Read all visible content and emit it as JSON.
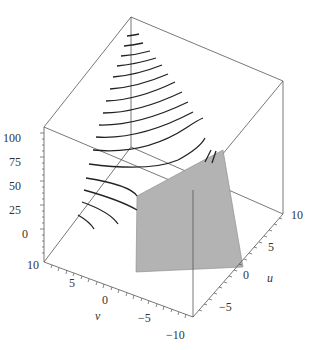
{
  "chart_data": {
    "type": "surface3d",
    "title": "",
    "axes": {
      "z": {
        "label": "",
        "ticks": [
          "0",
          "25",
          "50",
          "75",
          "100"
        ],
        "range": [
          0,
          100
        ]
      },
      "v": {
        "label": "v",
        "ticks": [
          "10",
          "5",
          "0",
          "-5",
          "-10"
        ],
        "range": [
          -10,
          10
        ]
      },
      "u": {
        "label": "u",
        "ticks": [
          "-5",
          "0",
          "5",
          "10"
        ],
        "range": [
          -10,
          10
        ]
      }
    },
    "box": "boxed",
    "series": [
      {
        "name": "curve family",
        "style": "black lines",
        "count": 15
      },
      {
        "name": "plane",
        "style": "gray filled polygon",
        "color": "#b3b3b3"
      }
    ]
  },
  "labels": {
    "z_ticks": [
      {
        "text": "100",
        "x": 3,
        "y": 131
      },
      {
        "text": "75",
        "x": 9,
        "y": 155
      },
      {
        "text": "50",
        "x": 9,
        "y": 179
      },
      {
        "text": "25",
        "x": 9,
        "y": 203
      },
      {
        "text": "0",
        "x": 22,
        "y": 227
      }
    ],
    "v_ticks": [
      {
        "text": "10",
        "x": 27,
        "y": 258
      },
      {
        "text": "5",
        "x": 69,
        "y": 276
      },
      {
        "text": "0",
        "x": 102,
        "y": 293
      },
      {
        "text": "−5",
        "x": 138,
        "y": 311
      },
      {
        "text": "−10",
        "x": 166,
        "y": 328
      }
    ],
    "u_ticks": [
      {
        "text": "10",
        "x": 291,
        "y": 208
      },
      {
        "text": "5",
        "x": 268,
        "y": 240
      },
      {
        "text": "0",
        "x": 243,
        "y": 268
      },
      {
        "text": "−5",
        "x": 219,
        "y": 300
      }
    ],
    "v_name": {
      "text": "v",
      "x": 95,
      "y": 309
    },
    "u_name": {
      "text": "u",
      "x": 267,
      "y": 271
    }
  }
}
